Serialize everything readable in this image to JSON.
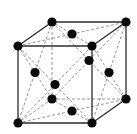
{
  "diagram": {
    "title": "Face-centered cubic unit cell",
    "type": "crystal-lattice",
    "lattice": "fcc",
    "colors": {
      "atom": "#0a0a0a",
      "solid_edge": "#2b2b2b",
      "dashed_line": "#7a7a7a",
      "background": "#ffffff"
    },
    "atoms": [
      {
        "id": "corner-000",
        "kind": "corner",
        "frac": [
          0,
          0,
          0
        ]
      },
      {
        "id": "corner-100",
        "kind": "corner",
        "frac": [
          1,
          0,
          0
        ]
      },
      {
        "id": "corner-001",
        "kind": "corner",
        "frac": [
          0,
          0,
          1
        ]
      },
      {
        "id": "corner-101",
        "kind": "corner",
        "frac": [
          1,
          0,
          1
        ]
      },
      {
        "id": "corner-010",
        "kind": "corner",
        "frac": [
          0,
          1,
          0
        ]
      },
      {
        "id": "corner-110",
        "kind": "corner",
        "frac": [
          1,
          1,
          0
        ]
      },
      {
        "id": "corner-011",
        "kind": "corner",
        "frac": [
          0,
          1,
          1
        ]
      },
      {
        "id": "corner-111",
        "kind": "corner",
        "frac": [
          1,
          1,
          1
        ]
      },
      {
        "id": "face-top",
        "kind": "face-center",
        "frac": [
          0.5,
          0.5,
          1
        ]
      },
      {
        "id": "face-bottom",
        "kind": "face-center",
        "frac": [
          0.5,
          0.5,
          0
        ]
      },
      {
        "id": "face-front",
        "kind": "face-center",
        "frac": [
          0.5,
          0,
          0.5
        ]
      },
      {
        "id": "face-back",
        "kind": "face-center",
        "frac": [
          0.5,
          1,
          0.5
        ]
      },
      {
        "id": "face-left",
        "kind": "face-center",
        "frac": [
          0,
          0.5,
          0.5
        ]
      },
      {
        "id": "face-right",
        "kind": "face-center",
        "frac": [
          1,
          0.5,
          0.5
        ]
      }
    ],
    "edges": [
      {
        "from": "corner-001",
        "to": "corner-101",
        "style": "solid"
      },
      {
        "from": "corner-001",
        "to": "corner-011",
        "style": "solid"
      },
      {
        "from": "corner-011",
        "to": "corner-111",
        "style": "solid"
      },
      {
        "from": "corner-111",
        "to": "corner-101",
        "style": "solid"
      },
      {
        "from": "corner-001",
        "to": "corner-000",
        "style": "solid"
      },
      {
        "from": "corner-000",
        "to": "corner-100",
        "style": "solid"
      },
      {
        "from": "corner-101",
        "to": "corner-100",
        "style": "solid"
      },
      {
        "from": "corner-111",
        "to": "corner-110",
        "style": "solid"
      },
      {
        "from": "corner-110",
        "to": "corner-100",
        "style": "solid"
      },
      {
        "from": "corner-011",
        "to": "corner-010",
        "style": "dashed"
      },
      {
        "from": "corner-010",
        "to": "corner-000",
        "style": "dashed"
      },
      {
        "from": "corner-010",
        "to": "corner-110",
        "style": "dashed"
      }
    ],
    "face_diagonals": [
      {
        "from": "corner-001",
        "to": "corner-111",
        "style": "dashed"
      },
      {
        "from": "corner-101",
        "to": "corner-011",
        "style": "dashed"
      },
      {
        "from": "corner-000",
        "to": "corner-110",
        "style": "dashed"
      },
      {
        "from": "corner-100",
        "to": "corner-010",
        "style": "dashed"
      },
      {
        "from": "corner-001",
        "to": "corner-100",
        "style": "dashed"
      },
      {
        "from": "corner-101",
        "to": "corner-000",
        "style": "dashed"
      },
      {
        "from": "corner-011",
        "to": "corner-110",
        "style": "dashed"
      },
      {
        "from": "corner-111",
        "to": "corner-010",
        "style": "dashed"
      },
      {
        "from": "corner-001",
        "to": "corner-010",
        "style": "dashed"
      },
      {
        "from": "corner-011",
        "to": "corner-000",
        "style": "dashed"
      },
      {
        "from": "corner-101",
        "to": "corner-110",
        "style": "dashed"
      },
      {
        "from": "corner-111",
        "to": "corner-100",
        "style": "dashed"
      }
    ]
  }
}
